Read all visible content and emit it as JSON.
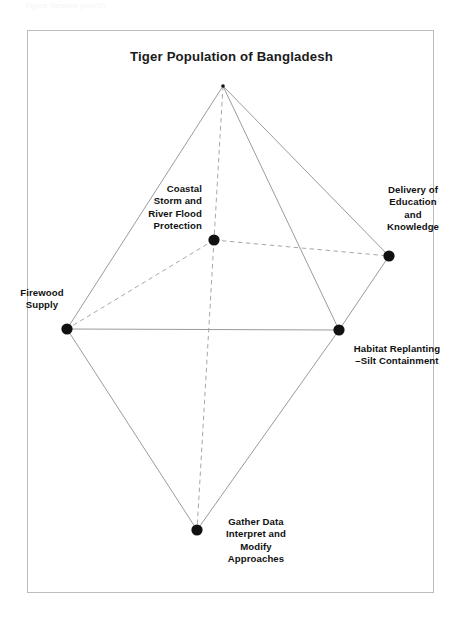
{
  "scan_header": {
    "text": "Figure  Network  (cont'd)"
  },
  "figure": {
    "title": "Tiger Population of Bangladesh",
    "frame_color": "#b9bcc0",
    "background": "#ffffff"
  },
  "chart_data": {
    "type": "diagram",
    "subtype": "node-link-network",
    "title": "Tiger Population of Bangladesh",
    "xlabel": "",
    "ylabel": "",
    "grid": false,
    "legend": null,
    "colors": {
      "node_fill": "#111111",
      "solid_edge": "#8c8f93",
      "dashed_edge": "#9a9da1",
      "label_text": "#111111",
      "title_text": "#1b1b1b"
    },
    "nodes": [
      {
        "id": "apex",
        "label": "",
        "x": 223,
        "y": 86,
        "radius": 1.8,
        "labeled": false,
        "label_align": "center"
      },
      {
        "id": "coastal",
        "label": "Coastal\nStorm and\nRiver Flood\nProtection",
        "x": 214,
        "y": 240,
        "radius": 5.6,
        "labeled": true,
        "label_align": "right"
      },
      {
        "id": "delivery",
        "label": "Delivery of\nEducation\nand\nKnowledge",
        "x": 389,
        "y": 256,
        "radius": 5.6,
        "labeled": true,
        "label_align": "center"
      },
      {
        "id": "firewood",
        "label": "Firewood\nSupply",
        "x": 67,
        "y": 329,
        "radius": 5.6,
        "labeled": true,
        "label_align": "center"
      },
      {
        "id": "habitat",
        "label": "Habitat Replanting\n–Silt Containment",
        "x": 339,
        "y": 330,
        "radius": 5.6,
        "labeled": true,
        "label_align": "center"
      },
      {
        "id": "gather",
        "label": "Gather Data\nInterpret and\nModify\nApproaches",
        "x": 197,
        "y": 530,
        "radius": 5.6,
        "labeled": true,
        "label_align": "center"
      }
    ],
    "edges": [
      {
        "from": "apex",
        "to": "firewood",
        "style": "solid"
      },
      {
        "from": "apex",
        "to": "habitat",
        "style": "solid"
      },
      {
        "from": "apex",
        "to": "delivery",
        "style": "solid"
      },
      {
        "from": "firewood",
        "to": "habitat",
        "style": "solid"
      },
      {
        "from": "firewood",
        "to": "gather",
        "style": "solid"
      },
      {
        "from": "habitat",
        "to": "gather",
        "style": "solid"
      },
      {
        "from": "habitat",
        "to": "delivery",
        "style": "solid"
      },
      {
        "from": "apex",
        "to": "coastal",
        "style": "dashed"
      },
      {
        "from": "coastal",
        "to": "firewood",
        "style": "dashed"
      },
      {
        "from": "coastal",
        "to": "delivery",
        "style": "dashed"
      },
      {
        "from": "coastal",
        "to": "gather",
        "style": "dashed"
      }
    ]
  }
}
